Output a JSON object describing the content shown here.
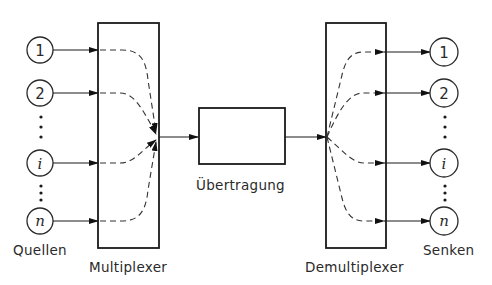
{
  "diagram": {
    "sources": {
      "label": "Quellen",
      "nodes": [
        {
          "id": "1",
          "label": "1",
          "italic": false
        },
        {
          "id": "2",
          "label": "2",
          "italic": false
        },
        {
          "id": "i",
          "label": "i",
          "italic": true
        },
        {
          "id": "n",
          "label": "n",
          "italic": true
        }
      ]
    },
    "multiplexer": {
      "label": "Multiplexer"
    },
    "channel": {
      "label": "Übertragung"
    },
    "demultiplexer": {
      "label": "Demultiplexer"
    },
    "sinks": {
      "label": "Senken",
      "nodes": [
        {
          "id": "1",
          "label": "1",
          "italic": false
        },
        {
          "id": "2",
          "label": "2",
          "italic": false
        },
        {
          "id": "i",
          "label": "i",
          "italic": true
        },
        {
          "id": "n",
          "label": "n",
          "italic": true
        }
      ]
    },
    "ellipsis": "⋮",
    "colors": {
      "stroke": "#1a1a1a",
      "text": "#2a2a2a",
      "background": "#ffffff"
    }
  }
}
